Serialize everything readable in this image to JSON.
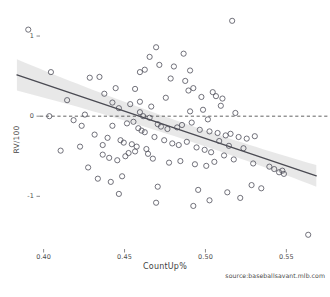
{
  "chart_data": {
    "type": "scatter",
    "title": "",
    "xlabel": "CountUp%",
    "ylabel": "RV/100",
    "caption": "source:baseballsavant.mlb.com",
    "xlim": [
      0.3755,
      0.5745
    ],
    "ylim": [
      -1.62,
      1.3
    ],
    "grid": false,
    "legend": null,
    "xticks": [
      0.4,
      0.45,
      0.5,
      0.55
    ],
    "xticklabels": [
      "0.40",
      "0.45",
      "0.50",
      "0.55"
    ],
    "yticks": [
      1,
      0,
      -1
    ],
    "yticklabels": [
      "1",
      "0",
      "-1"
    ],
    "marker": {
      "shape": "open-circle",
      "radius": 2.6,
      "stroke": "#4f4f5a",
      "fill": "none",
      "stroke_width": 0.8
    },
    "reference_line": {
      "orientation": "horizontal",
      "y": 0,
      "style": "dashed",
      "color": "#3a3a3a"
    },
    "trend_line": {
      "type": "linear-fit",
      "color": "#4a4a52",
      "width": 1.3,
      "x_start": 0.3835,
      "y_start": 0.515,
      "x_end": 0.5685,
      "y_end": -0.745,
      "band_color": "#d6d6d6",
      "band_opacity": 0.55,
      "band_halfwidth_start": 0.195,
      "band_halfwidth_mid": 0.042,
      "band_halfwidth_end": 0.135
    },
    "x": [
      0.3905,
      0.5165,
      0.4045,
      0.4595,
      0.4695,
      0.4655,
      0.4865,
      0.4285,
      0.4345,
      0.4375,
      0.4445,
      0.4715,
      0.4625,
      0.4805,
      0.4905,
      0.4785,
      0.4565,
      0.4595,
      0.4875,
      0.4925,
      0.5045,
      0.4145,
      0.5065,
      0.4975,
      0.4535,
      0.4755,
      0.5105,
      0.5095,
      0.4665,
      0.4895,
      0.4425,
      0.4465,
      0.4255,
      0.4595,
      0.4985,
      0.4905,
      0.5185,
      0.4615,
      0.4655,
      0.5015,
      0.4035,
      0.4185,
      0.4425,
      0.4515,
      0.4555,
      0.4585,
      0.4605,
      0.4625,
      0.4705,
      0.4725,
      0.4765,
      0.4825,
      0.4855,
      0.4915,
      0.4965,
      0.5025,
      0.5075,
      0.5125,
      0.5155,
      0.5205,
      0.5255,
      0.5305,
      0.4315,
      0.4395,
      0.4475,
      0.4495,
      0.4545,
      0.4575,
      0.4635,
      0.4685,
      0.4745,
      0.4795,
      0.4835,
      0.4885,
      0.4945,
      0.4995,
      0.5035,
      0.5085,
      0.5145,
      0.5235,
      0.4105,
      0.4235,
      0.4365,
      0.4405,
      0.4455,
      0.4505,
      0.4525,
      0.4565,
      0.4645,
      0.4675,
      0.4775,
      0.4845,
      0.4935,
      0.5005,
      0.5055,
      0.5115,
      0.5175,
      0.5295,
      0.5395,
      0.5425,
      0.5455,
      0.5475,
      0.5485,
      0.5635,
      0.4225,
      0.4275,
      0.4335,
      0.4415,
      0.4485,
      0.4705,
      0.4955,
      0.5135,
      0.5215,
      0.5285,
      0.5345,
      0.4925,
      0.5025,
      0.4695,
      0.4465,
      0.4365
    ],
    "y": [
      1.08,
      1.19,
      0.55,
      0.55,
      0.86,
      0.74,
      0.78,
      0.48,
      0.49,
      0.28,
      0.35,
      0.64,
      0.58,
      0.62,
      0.57,
      0.47,
      0.34,
      0.18,
      0.44,
      0.35,
      0.3,
      0.2,
      0.25,
      0.24,
      0.15,
      0.23,
      0.22,
      0.13,
      0.12,
      0.32,
      0.17,
      0.1,
      0.02,
      0.05,
      0.08,
      0.06,
      0.04,
      0.0,
      -0.02,
      -0.04,
      0.0,
      -0.05,
      -0.12,
      -0.09,
      -0.07,
      -0.15,
      -0.18,
      -0.2,
      -0.1,
      -0.13,
      -0.16,
      -0.14,
      -0.11,
      -0.08,
      -0.17,
      -0.19,
      -0.21,
      -0.24,
      -0.22,
      -0.26,
      -0.28,
      -0.25,
      -0.23,
      -0.27,
      -0.3,
      -0.33,
      -0.35,
      -0.38,
      -0.41,
      -0.26,
      -0.3,
      -0.34,
      -0.36,
      -0.32,
      -0.39,
      -0.42,
      -0.45,
      -0.31,
      -0.37,
      -0.4,
      -0.43,
      -0.12,
      -0.48,
      -0.52,
      -0.55,
      -0.5,
      -0.46,
      -0.44,
      -0.47,
      -0.53,
      -0.58,
      -0.56,
      -0.6,
      -0.62,
      -0.57,
      -0.49,
      -0.54,
      -0.59,
      -0.63,
      -0.66,
      -0.7,
      -0.68,
      -0.72,
      -1.48,
      -0.38,
      -0.64,
      -0.78,
      -0.82,
      -0.75,
      -0.88,
      -0.92,
      -0.95,
      -1.02,
      -0.86,
      -0.9,
      -1.12,
      -1.05,
      -1.08,
      -0.97,
      -0.36
    ]
  }
}
